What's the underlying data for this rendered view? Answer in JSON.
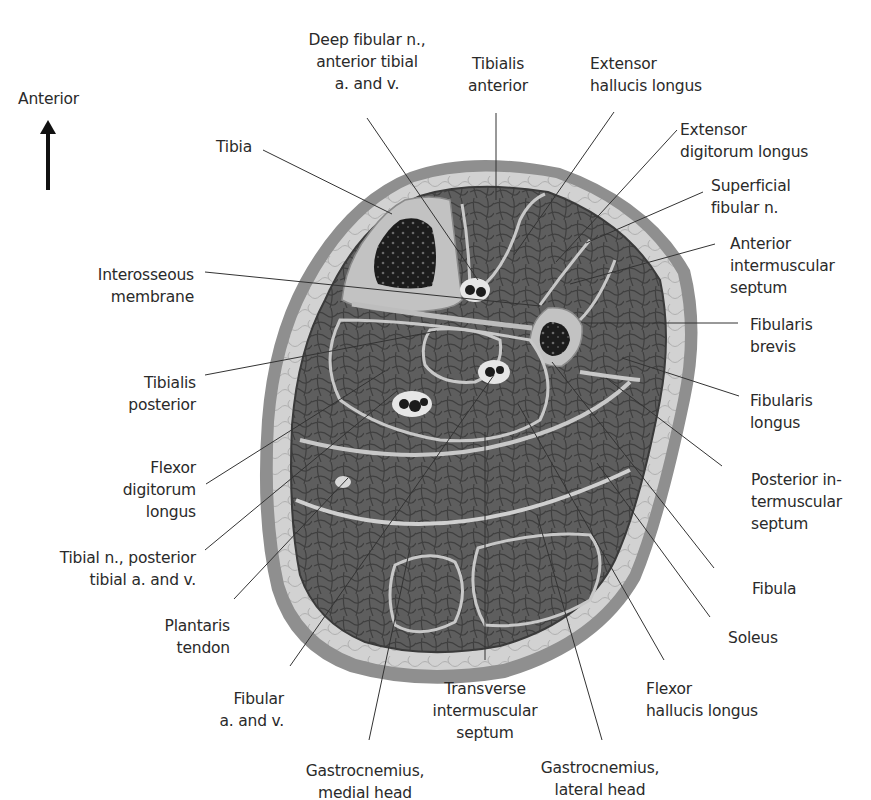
{
  "figure": {
    "orientation": {
      "label": "Anterior",
      "arrow": "arrow-up-icon"
    }
  },
  "labels": {
    "deep_fibular": "Deep fibular n.,\nanterior tibial\na. and v.",
    "tibialis_anterior": "Tibialis\nanterior",
    "extensor_hallucis_longus": "Extensor\nhallucis longus",
    "extensor_digitorum_longus": "Extensor\ndigitorum longus",
    "superficial_fibular": "Superficial\nfibular n.",
    "anterior_intermuscular_septum": "Anterior\nintermuscular\nseptum",
    "fibularis_brevis": "Fibularis\nbrevis",
    "fibularis_longus": "Fibularis\nlongus",
    "posterior_intermuscular_septum": "Posterior in-\ntermuscular\nseptum",
    "fibula": "Fibula",
    "soleus": "Soleus",
    "flexor_hallucis_longus": "Flexor\nhallucis longus",
    "gastrocnemius_lateral": "Gastrocnemius,\nlateral head",
    "transverse_intermuscular_septum": "Transverse\nintermuscular\nseptum",
    "gastrocnemius_medial": "Gastrocnemius,\nmedial head",
    "fibular_av": "Fibular\na. and v.",
    "plantaris_tendon": "Plantaris\ntendon",
    "tibial_n": "Tibial n., posterior\ntibial a. and v.",
    "flexor_digitorum_longus": "Flexor\ndigitorum\nlongus",
    "tibialis_posterior": "Tibialis\nposterior",
    "interosseous_membrane": "Interosseous\nmembrane",
    "tibia": "Tibia"
  },
  "colors": {
    "skin": "#8f8f8f",
    "subcutaneous_fat": "#d2d2d2",
    "muscle": "#5e5e5e",
    "fascia": "#c8c8c8",
    "bone_cortex": "#c2c2c2",
    "marrow": "#1c1c1c",
    "leader_line": "#333333",
    "text": "#2a2a2a"
  }
}
